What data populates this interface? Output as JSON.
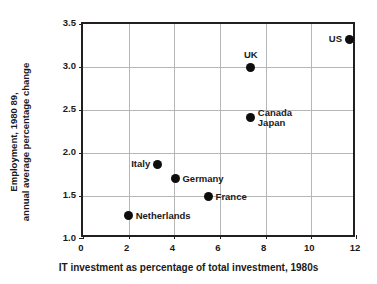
{
  "chart_data": {
    "type": "scatter",
    "title": "",
    "xlabel": "IT investment as percentage of total investment, 1980s",
    "ylabel_line1": "Employment, 1980 89,",
    "ylabel_line2": "annual average percentage change",
    "xlim": [
      0,
      12
    ],
    "ylim": [
      1.0,
      3.5
    ],
    "xticks": [
      0,
      2,
      4,
      6,
      8,
      10,
      12
    ],
    "xtick_labels": [
      "0",
      "2",
      "4",
      "6",
      "8",
      "10",
      "12"
    ],
    "yticks": [
      1.0,
      1.5,
      2.0,
      2.5,
      3.0,
      3.5
    ],
    "ytick_labels": [
      "1.0",
      "1.5",
      "2.0",
      "2.5",
      "3.0",
      "3.5"
    ],
    "gridlines_x": [
      2,
      4,
      6,
      8,
      10
    ],
    "gridlines_y": [
      1.5,
      2.0,
      2.5,
      3.0
    ],
    "grid": true,
    "legend": "none",
    "marker_color": "#0d0d0d",
    "grid_color": "#b6b6b6",
    "axis_color": "#231f20",
    "points": [
      {
        "label": "US",
        "x": 11.65,
        "y": 3.32,
        "label_pos": "left"
      },
      {
        "label": "UK",
        "x": 7.35,
        "y": 3.0,
        "label_pos": "above"
      },
      {
        "label": "Canada",
        "x": 7.35,
        "y": 2.41,
        "label_pos": "right",
        "label2": "Japan"
      },
      {
        "label": "Italy",
        "x": 3.25,
        "y": 1.87,
        "label_pos": "left"
      },
      {
        "label": "Germany",
        "x": 4.05,
        "y": 1.7,
        "label_pos": "right"
      },
      {
        "label": "France",
        "x": 5.5,
        "y": 1.49,
        "label_pos": "right"
      },
      {
        "label": "Netherlands",
        "x": 2.0,
        "y": 1.27,
        "label_pos": "right"
      }
    ]
  }
}
